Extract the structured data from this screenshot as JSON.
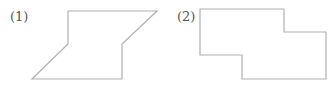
{
  "figures": [
    {
      "label": "(1)",
      "shape": "polygon",
      "points": "68,11 157,11 122,44 122,79 32,79 68,44",
      "stroke": "#b0b0b0"
    },
    {
      "label": "(2)",
      "shape": "polygon",
      "points": "200,9 284,9 284,32 326,32 326,79 242,79 242,55 200,55",
      "stroke": "#b0b0b0"
    }
  ]
}
